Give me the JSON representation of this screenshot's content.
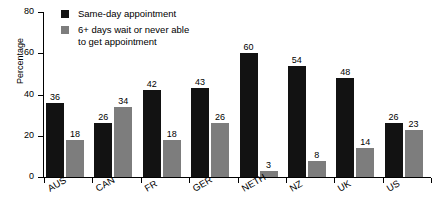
{
  "chart_data": {
    "type": "bar",
    "title": "",
    "xlabel": "",
    "ylabel": "Percentage",
    "ylim": [
      0,
      80
    ],
    "yticks": [
      0,
      20,
      40,
      60,
      80
    ],
    "grid": false,
    "legend_position": "top-center",
    "categories": [
      "AUS",
      "CAN",
      "FR",
      "GER",
      "NETH",
      "NZ",
      "UK",
      "US"
    ],
    "series": [
      {
        "name": "Same-day appointment",
        "color": "#121212",
        "values": [
          36,
          26,
          42,
          43,
          60,
          54,
          48,
          26
        ]
      },
      {
        "name": "6+ days wait or never able to get appointment",
        "color": "#7d7d7d",
        "values": [
          18,
          34,
          18,
          26,
          3,
          8,
          14,
          23
        ]
      }
    ]
  },
  "legend": {
    "items": [
      {
        "label": "Same-day appointment",
        "label_line2": ""
      },
      {
        "label": "6+ days wait or never able",
        "label_line2": "to get appointment"
      }
    ]
  }
}
